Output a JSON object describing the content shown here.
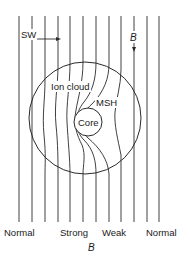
{
  "diagram": {
    "labels": {
      "solar_wind": "SW",
      "field_top": "B",
      "ion_cloud": "Ion cloud",
      "magnetosheath": "MSH",
      "core": "Core",
      "bottom_normal_left": "Normal",
      "bottom_strong": "Strong",
      "bottom_weak": "Weak",
      "bottom_normal_right": "Normal",
      "field_bottom": "B"
    },
    "field_lines": {
      "count": 12,
      "x_positions": [
        19,
        32,
        45,
        58,
        70,
        83,
        96,
        109,
        121,
        134,
        147,
        159
      ],
      "y_top": 16,
      "y_bottom": 222
    },
    "ion_cloud_circle": {
      "cx": 85,
      "cy": 118,
      "r": 56
    },
    "core_circle": {
      "cx": 88,
      "cy": 122,
      "r": 14
    },
    "colors": {
      "stroke": "#2a2a2a",
      "background": "#ffffff",
      "text": "#1a1a1a"
    }
  }
}
